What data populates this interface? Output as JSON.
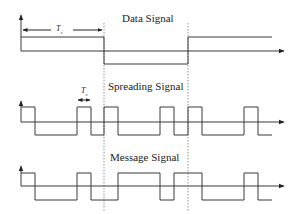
{
  "diagram": {
    "panels": [
      {
        "id": "data",
        "title": "Data Signal",
        "period_label": "Ts",
        "levels": [
          "high",
          "low",
          "high"
        ],
        "bit_boundaries_x": [
          21,
          104,
          188,
          272
        ]
      },
      {
        "id": "spreading",
        "title": "Spreading Signal",
        "period_label": "Tc",
        "chips": [
          1,
          0,
          0,
          0,
          1,
          0,
          1,
          0,
          0,
          0,
          1,
          0,
          1,
          0,
          0,
          0,
          1,
          0
        ]
      },
      {
        "id": "message",
        "title": "Message Signal",
        "chips": [
          1,
          0,
          0,
          0,
          1,
          0,
          0,
          1,
          1,
          1,
          0,
          1,
          1,
          0,
          0,
          0,
          1,
          0
        ]
      }
    ],
    "colors": {
      "line": "#3a3a3a",
      "axis": "#3a3a3a",
      "dotted": "#777777",
      "text": "#222222"
    }
  }
}
